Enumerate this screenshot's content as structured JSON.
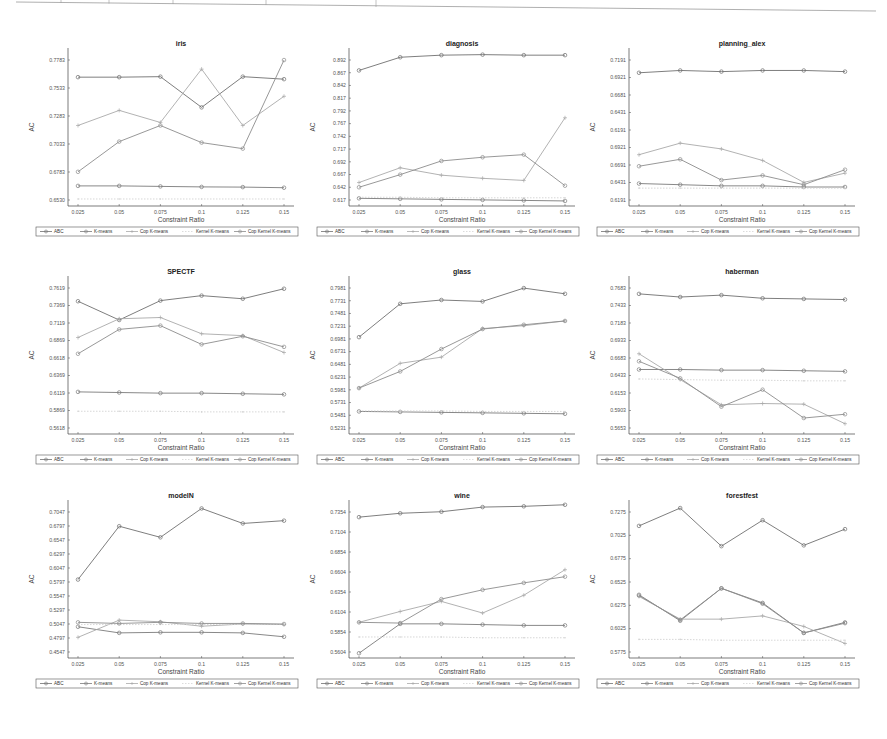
{
  "figure": {
    "series_names": [
      "ABC",
      "K-means",
      "Cop K-means",
      "Kernel K-means",
      "Cop Kernel K-means"
    ],
    "series_colors": [
      "#6f6f6f",
      "#7a7a7a",
      "#a9a9a9",
      "#d3d3d3",
      "#8c8c8c"
    ],
    "xlabel": "Constraint Ratio",
    "ylabel": "AC"
  },
  "chart_data": [
    {
      "type": "line",
      "title": "iris",
      "categories": [
        "0.025",
        "0.05",
        "0.075",
        "0.1",
        "0.125",
        "0.15"
      ],
      "xlabel": "Constraint Ratio",
      "ylabel": "AC",
      "yticks": [
        "0.6530",
        "0.6783",
        "0.7033",
        "0.7283",
        "0.7533",
        "0.7783"
      ],
      "ylim": [
        0.651,
        0.8
      ],
      "legend_position": "bottom",
      "series": [
        {
          "name": "ABC",
          "values": [
            0.775,
            0.775,
            0.7755,
            0.745,
            0.7755,
            0.773
          ]
        },
        {
          "name": "K-means",
          "values": [
            0.667,
            0.667,
            0.6665,
            0.666,
            0.6658,
            0.6652
          ]
        },
        {
          "name": "Cop K-means",
          "values": [
            0.727,
            0.742,
            0.73,
            0.783,
            0.727,
            0.756
          ]
        },
        {
          "name": "Kernel K-means",
          "values": [
            0.654,
            0.654,
            0.654,
            0.654,
            0.654,
            0.654
          ]
        },
        {
          "name": "Cop Kernel K-means",
          "values": [
            0.681,
            0.711,
            0.727,
            0.71,
            0.704,
            0.792
          ]
        }
      ]
    },
    {
      "type": "line",
      "title": "diagnosis",
      "categories": [
        "0.025",
        "0.05",
        "0.075",
        "0.1",
        "0.125",
        "0.15"
      ],
      "xlabel": "Constraint Ratio",
      "ylabel": "AC",
      "yticks": [
        "0.617",
        "0.642",
        "0.667",
        "0.692",
        "0.717",
        "0.742",
        "0.767",
        "0.792",
        "0.817",
        "0.842",
        "0.867",
        "0.892"
      ],
      "ylim": [
        0.61,
        0.895
      ],
      "legend_position": "bottom",
      "series": [
        {
          "name": "ABC",
          "values": [
            0.86,
            0.885,
            0.889,
            0.89,
            0.889,
            0.889
          ]
        },
        {
          "name": "K-means",
          "values": [
            0.617,
            0.616,
            0.615,
            0.614,
            0.613,
            0.612
          ]
        },
        {
          "name": "Cop K-means",
          "values": [
            0.647,
            0.675,
            0.661,
            0.655,
            0.651,
            0.77
          ]
        },
        {
          "name": "Kernel K-means",
          "values": [
            0.619,
            0.619,
            0.618,
            0.618,
            0.618,
            0.618
          ]
        },
        {
          "name": "Cop Kernel K-means",
          "values": [
            0.638,
            0.662,
            0.688,
            0.695,
            0.7,
            0.641
          ]
        }
      ]
    },
    {
      "type": "line",
      "title": "planning_alex",
      "categories": [
        "0.025",
        "0.05",
        "0.075",
        "0.1",
        "0.125",
        "0.15"
      ],
      "xlabel": "Constraint Ratio",
      "ylabel": "AC",
      "yticks": [
        "0.6191",
        "0.6431",
        "0.6691",
        "0.6921",
        "0.6191",
        "0.6431",
        "0.6681",
        "0.6921",
        "0.7191"
      ],
      "ylim": [
        0.605,
        0.735
      ],
      "legend_position": "bottom",
      "series": [
        {
          "name": "ABC",
          "values": [
            0.717,
            0.719,
            0.718,
            0.719,
            0.719,
            0.718
          ]
        },
        {
          "name": "K-means",
          "values": [
            0.621,
            0.62,
            0.619,
            0.619,
            0.618,
            0.618
          ]
        },
        {
          "name": "Cop K-means",
          "values": [
            0.646,
            0.656,
            0.651,
            0.641,
            0.622,
            0.63
          ]
        },
        {
          "name": "Kernel K-means",
          "values": [
            0.617,
            0.617,
            0.617,
            0.617,
            0.617,
            0.617
          ]
        },
        {
          "name": "Cop Kernel K-means",
          "values": [
            0.636,
            0.642,
            0.624,
            0.628,
            0.62,
            0.633
          ]
        }
      ]
    },
    {
      "type": "line",
      "title": "SPECTF",
      "categories": [
        "0.025",
        "0.05",
        "0.075",
        "0.1",
        "0.125",
        "0.15"
      ],
      "xlabel": "Constraint Ratio",
      "ylabel": "AC",
      "yticks": [
        "0.5618",
        "0.5869",
        "0.6119",
        "0.6369",
        "0.6618",
        "0.6869",
        "0.7119",
        "0.7369",
        "0.7619"
      ],
      "ylim": [
        0.555,
        0.795
      ],
      "legend_position": "bottom",
      "series": [
        {
          "name": "ABC",
          "values": [
            0.761,
            0.731,
            0.762,
            0.77,
            0.765,
            0.781
          ]
        },
        {
          "name": "K-means",
          "values": [
            0.616,
            0.615,
            0.614,
            0.614,
            0.613,
            0.612
          ]
        },
        {
          "name": "Cop K-means",
          "values": [
            0.703,
            0.733,
            0.735,
            0.709,
            0.706,
            0.679
          ]
        },
        {
          "name": "Kernel K-means",
          "values": [
            0.585,
            0.585,
            0.585,
            0.584,
            0.584,
            0.584
          ]
        },
        {
          "name": "Cop Kernel K-means",
          "values": [
            0.677,
            0.716,
            0.722,
            0.692,
            0.705,
            0.688
          ]
        }
      ]
    },
    {
      "type": "line",
      "title": "glass",
      "categories": [
        "0.025",
        "0.05",
        "0.075",
        "0.1",
        "0.125",
        "0.15"
      ],
      "xlabel": "Constraint Ratio",
      "ylabel": "AC",
      "yticks": [
        "0.5231",
        "0.5481",
        "0.5731",
        "0.5981",
        "0.6231",
        "0.6481",
        "0.6731",
        "0.6981",
        "0.7231",
        "0.7481",
        "0.7731",
        "0.7981"
      ],
      "ylim": [
        0.51,
        0.825
      ],
      "legend_position": "bottom",
      "series": [
        {
          "name": "ABC",
          "values": [
            0.705,
            0.775,
            0.783,
            0.78,
            0.808,
            0.796
          ]
        },
        {
          "name": "K-means",
          "values": [
            0.549,
            0.548,
            0.547,
            0.546,
            0.545,
            0.544
          ]
        },
        {
          "name": "Cop K-means",
          "values": [
            0.598,
            0.65,
            0.663,
            0.723,
            0.729,
            0.739
          ]
        },
        {
          "name": "Kernel K-means",
          "values": [
            0.55,
            0.55,
            0.55,
            0.549,
            0.549,
            0.549
          ]
        },
        {
          "name": "Cop Kernel K-means",
          "values": [
            0.598,
            0.633,
            0.68,
            0.722,
            0.731,
            0.739
          ]
        }
      ]
    },
    {
      "type": "line",
      "title": "haberman",
      "categories": [
        "0.025",
        "0.05",
        "0.075",
        "0.1",
        "0.125",
        "0.15"
      ],
      "xlabel": "Constraint Ratio",
      "ylabel": "AC",
      "yticks": [
        "0.5653",
        "0.5903",
        "0.6153",
        "0.6433",
        "0.6683",
        "0.6933",
        "0.7183",
        "0.7433",
        "0.7683"
      ],
      "ylim": [
        0.552,
        0.79
      ],
      "legend_position": "bottom",
      "series": [
        {
          "name": "ABC",
          "values": [
            0.768,
            0.763,
            0.766,
            0.761,
            0.76,
            0.759
          ]
        },
        {
          "name": "K-means",
          "values": [
            0.648,
            0.648,
            0.647,
            0.647,
            0.646,
            0.645
          ]
        },
        {
          "name": "Cop K-means",
          "values": [
            0.673,
            0.632,
            0.592,
            0.594,
            0.593,
            0.562
          ]
        },
        {
          "name": "Kernel K-means",
          "values": [
            0.633,
            0.632,
            0.631,
            0.631,
            0.63,
            0.63
          ]
        },
        {
          "name": "Cop Kernel K-means",
          "values": [
            0.661,
            0.634,
            0.589,
            0.616,
            0.571,
            0.577
          ]
        }
      ]
    },
    {
      "type": "line",
      "title": "modelN",
      "categories": [
        "0.025",
        "0.05",
        "0.075",
        "0.1",
        "0.125",
        "0.15"
      ],
      "xlabel": "Constraint Ratio",
      "ylabel": "AC",
      "yticks": [
        "0.4547",
        "0.4797",
        "0.5047",
        "0.5297",
        "0.5547",
        "0.5797",
        "0.6047",
        "0.6297",
        "0.6547",
        "0.6797",
        "0.7047"
      ],
      "ylim": [
        0.45,
        0.72
      ],
      "legend_position": "bottom",
      "series": [
        {
          "name": "ABC",
          "values": [
            0.584,
            0.68,
            0.66,
            0.712,
            0.685,
            0.69
          ]
        },
        {
          "name": "K-means",
          "values": [
            0.499,
            0.488,
            0.489,
            0.489,
            0.488,
            0.481
          ]
        },
        {
          "name": "Cop K-means",
          "values": [
            0.48,
            0.511,
            0.508,
            0.5,
            0.504,
            0.503
          ]
        },
        {
          "name": "Kernel K-means",
          "values": [
            0.503,
            0.503,
            0.503,
            0.503,
            0.503,
            0.503
          ]
        },
        {
          "name": "Cop Kernel K-means",
          "values": [
            0.507,
            0.505,
            0.507,
            0.505,
            0.505,
            0.504
          ]
        }
      ]
    },
    {
      "type": "line",
      "title": "wine",
      "categories": [
        "0.025",
        "0.05",
        "0.075",
        "0.1",
        "0.125",
        "0.15"
      ],
      "xlabel": "Constraint Ratio",
      "ylabel": "AC",
      "yticks": [
        "0.5604",
        "0.5854",
        "0.6104",
        "0.6354",
        "0.6604",
        "0.6854",
        "0.7104",
        "0.7354"
      ],
      "ylim": [
        0.558,
        0.752
      ],
      "legend_position": "bottom",
      "series": [
        {
          "name": "ABC",
          "values": [
            0.735,
            0.74,
            0.742,
            0.748,
            0.749,
            0.751
          ]
        },
        {
          "name": "K-means",
          "values": [
            0.559,
            0.597,
            0.597,
            0.596,
            0.595,
            0.595
          ]
        },
        {
          "name": "Cop K-means",
          "values": [
            0.599,
            0.613,
            0.626,
            0.611,
            0.634,
            0.667
          ]
        },
        {
          "name": "Kernel K-means",
          "values": [
            0.58,
            0.58,
            0.58,
            0.579,
            0.579,
            0.579
          ]
        },
        {
          "name": "Cop Kernel K-means",
          "values": [
            0.599,
            0.598,
            0.629,
            0.641,
            0.65,
            0.658
          ]
        }
      ]
    },
    {
      "type": "line",
      "title": "forestfest",
      "categories": [
        "0.025",
        "0.05",
        "0.075",
        "0.1",
        "0.125",
        "0.15"
      ],
      "xlabel": "Constraint Ratio",
      "ylabel": "AC",
      "yticks": [
        "0.5775",
        "0.6025",
        "0.6275",
        "0.6525",
        "0.6775",
        "0.7025",
        "0.7275"
      ],
      "ylim": [
        0.56,
        0.745
      ],
      "legend_position": "bottom",
      "series": [
        {
          "name": "ABC",
          "values": [
            0.718,
            0.74,
            0.693,
            0.725,
            0.694,
            0.714
          ]
        },
        {
          "name": "K-means",
          "values": [
            0.633,
            0.601,
            0.641,
            0.623,
            0.586,
            0.599
          ]
        },
        {
          "name": "Cop K-means",
          "values": [
            0.631,
            0.603,
            0.603,
            0.607,
            0.594,
            0.573
          ]
        },
        {
          "name": "Kernel K-means",
          "values": [
            0.578,
            0.578,
            0.577,
            0.577,
            0.577,
            0.577
          ]
        },
        {
          "name": "Cop Kernel K-means",
          "values": [
            0.632,
            0.602,
            0.641,
            0.622,
            0.586,
            0.598
          ]
        }
      ]
    }
  ]
}
